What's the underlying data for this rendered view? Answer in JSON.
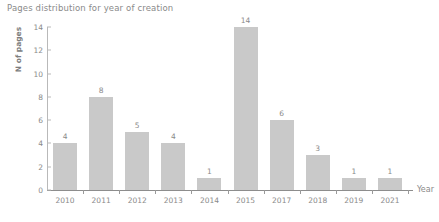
{
  "chart_data": {
    "type": "bar",
    "title": "Pages distribution for year of creation",
    "xlabel": "Year",
    "ylabel": "N of pages",
    "categories": [
      "2010",
      "2011",
      "2012",
      "2013",
      "2014",
      "2015",
      "2017",
      "2018",
      "2019",
      "2021"
    ],
    "values": [
      4,
      8,
      5,
      4,
      1,
      14,
      6,
      3,
      1,
      1
    ],
    "ylim": [
      0,
      14
    ],
    "yticks": [
      "0",
      "2",
      "4",
      "6",
      "8",
      "10",
      "12",
      "14"
    ],
    "ytick_values": [
      0,
      2,
      4,
      6,
      8,
      10,
      12,
      14
    ],
    "grid": false,
    "legend": "none",
    "bar_color": "#c9c9c9",
    "axis_color": "#8d8d8d",
    "text_color": "#8a8a8a",
    "show_value_labels": true
  }
}
